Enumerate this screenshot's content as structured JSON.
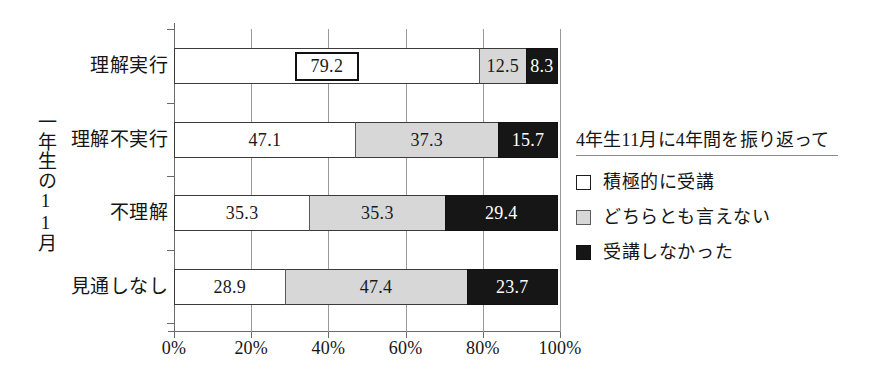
{
  "chart_data": {
    "type": "bar",
    "orientation": "horizontal",
    "stacked": true,
    "stack_mode": "percent",
    "title": "",
    "xlabel": "",
    "ylabel": "一年生の11月",
    "xlim": [
      0,
      100
    ],
    "xticks": [
      0,
      20,
      40,
      60,
      80,
      100
    ],
    "xtick_labels": [
      "0%",
      "20%",
      "40%",
      "60%",
      "80%",
      "100%"
    ],
    "grid": true,
    "legend_position": "right",
    "legend_title": "4年生11月に4年間を振り返って",
    "categories": [
      "理解実行",
      "理解不実行",
      "不理解",
      "見通しなし"
    ],
    "series": [
      {
        "name": "積極的に受講",
        "color": "#ffffff",
        "swatch": "sw-white",
        "seg_class": "seg-white",
        "values": [
          79.2,
          47.1,
          35.3,
          28.9
        ]
      },
      {
        "name": "どちらとも言えない",
        "color": "#d7d7d7",
        "swatch": "sw-gray",
        "seg_class": "seg-gray",
        "values": [
          12.5,
          37.3,
          35.3,
          47.4
        ]
      },
      {
        "name": "受講しなかった",
        "color": "#161616",
        "swatch": "sw-black",
        "seg_class": "seg-black",
        "values": [
          8.3,
          15.7,
          29.4,
          23.7
        ]
      }
    ],
    "bars": [
      {
        "category": "理解実行",
        "segments": [
          {
            "label": "79.2",
            "value": 79.2,
            "style": "seg-white",
            "boxed": true
          },
          {
            "label": "12.5",
            "value": 12.5,
            "style": "seg-gray",
            "boxed": false
          },
          {
            "label": "8.3",
            "value": 8.3,
            "style": "seg-black",
            "boxed": false
          }
        ]
      },
      {
        "category": "理解不実行",
        "segments": [
          {
            "label": "47.1",
            "value": 47.1,
            "style": "seg-white",
            "boxed": false
          },
          {
            "label": "37.3",
            "value": 37.3,
            "style": "seg-gray",
            "boxed": false
          },
          {
            "label": "15.7",
            "value": 15.7,
            "style": "seg-black",
            "boxed": false
          }
        ]
      },
      {
        "category": "不理解",
        "segments": [
          {
            "label": "35.3",
            "value": 35.3,
            "style": "seg-white",
            "boxed": false
          },
          {
            "label": "35.3",
            "value": 35.3,
            "style": "seg-gray",
            "boxed": false
          },
          {
            "label": "29.4",
            "value": 29.4,
            "style": "seg-black",
            "boxed": false
          }
        ]
      },
      {
        "category": "見通しなし",
        "segments": [
          {
            "label": "28.9",
            "value": 28.9,
            "style": "seg-white",
            "boxed": false
          },
          {
            "label": "47.4",
            "value": 47.4,
            "style": "seg-gray",
            "boxed": false
          },
          {
            "label": "23.7",
            "value": 23.7,
            "style": "seg-black",
            "boxed": false
          }
        ]
      }
    ]
  },
  "layout": {
    "bar_tops": [
      19,
      93,
      166,
      240
    ],
    "label_tops": [
      56,
      130,
      203,
      277
    ],
    "bar_height": 36,
    "plot_width": 386,
    "plot_height": 303
  }
}
